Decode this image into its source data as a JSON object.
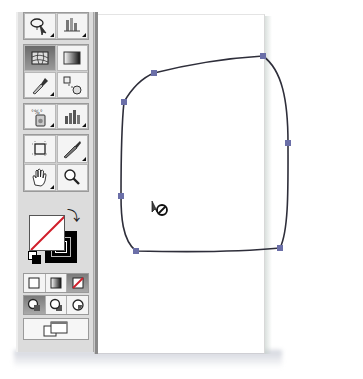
{
  "toolbox": {
    "groups": [
      {
        "tools": [
          {
            "name": "lasso-tool",
            "icon": "lasso-icon",
            "has_flyout": true
          },
          {
            "name": "graph-data-tool",
            "icon": "column-graph-icon",
            "has_flyout": true
          }
        ]
      },
      {
        "tools": [
          {
            "name": "mesh-tool",
            "icon": "mesh-icon",
            "has_flyout": false,
            "active": true
          },
          {
            "name": "gradient-tool",
            "icon": "gradient-icon",
            "has_flyout": false
          },
          {
            "name": "eyedropper-tool",
            "icon": "eyedropper-icon",
            "has_flyout": true
          },
          {
            "name": "blend-tool",
            "icon": "blend-icon",
            "has_flyout": false
          }
        ]
      },
      {
        "tools": [
          {
            "name": "symbol-sprayer-tool",
            "icon": "symbol-sprayer-icon",
            "has_flyout": true
          },
          {
            "name": "column-graph-tool",
            "icon": "bar-chart-icon",
            "has_flyout": true
          }
        ]
      },
      {
        "tools": [
          {
            "name": "crop-area-tool",
            "icon": "crop-area-icon",
            "has_flyout": false
          },
          {
            "name": "slice-tool",
            "icon": "knife-icon",
            "has_flyout": true
          },
          {
            "name": "hand-tool",
            "icon": "hand-icon",
            "has_flyout": true
          },
          {
            "name": "zoom-tool",
            "icon": "magnifier-icon",
            "has_flyout": false
          }
        ]
      }
    ],
    "fill_stroke": {
      "fill": "none",
      "stroke": "#000000",
      "swap_glyph": "⤵",
      "none_color": "#d01e2a"
    },
    "color_modes": [
      "color",
      "gradient",
      "none"
    ],
    "active_color_mode": "none",
    "draw_modes": [
      "draw-normal",
      "draw-behind",
      "draw-inside"
    ],
    "active_draw_mode": "draw-normal",
    "screen_mode": "change-screen-mode"
  },
  "canvas": {
    "path_color": "#2e2e3a",
    "anchor_color": "#6b6fa8",
    "anchors": [
      {
        "x": 154,
        "y": 73
      },
      {
        "x": 263,
        "y": 56
      },
      {
        "x": 288,
        "y": 143
      },
      {
        "x": 280,
        "y": 248
      },
      {
        "x": 136,
        "y": 251
      },
      {
        "x": 121,
        "y": 196
      },
      {
        "x": 124,
        "y": 102
      }
    ],
    "cursor": "eyedropper-not-allowed-cursor"
  }
}
